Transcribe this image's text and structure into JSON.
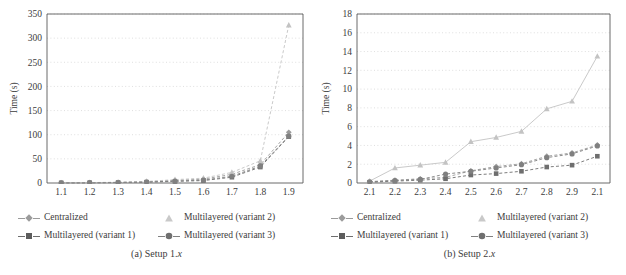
{
  "figure": {
    "panels": [
      {
        "id": "panel-a",
        "caption_prefix": "(a)",
        "caption_text": "Setup 1.",
        "caption_italic": "x",
        "ylabel": "Time (s)"
      },
      {
        "id": "panel-b",
        "caption_prefix": "(b)",
        "caption_text": "Setup 2.",
        "caption_italic": "x",
        "ylabel": "Time (s)"
      }
    ],
    "legend": {
      "entries": [
        {
          "label": "Centralized",
          "marker": "diamond-marker",
          "color": "#9b9b9b",
          "dash": "dashed"
        },
        {
          "label": "Multilayered (variant 2)",
          "marker": "triangle-marker",
          "color": "#c3c3c3",
          "dash": "solid"
        },
        {
          "label": "Multilayered (variant 1)",
          "marker": "square-marker",
          "color": "#6e6e6e",
          "dash": "dashed"
        },
        {
          "label": "Multilayered (variant 3)",
          "marker": "circle-marker",
          "color": "#808080",
          "dash": "dashed"
        }
      ]
    }
  },
  "chart_data": [
    {
      "type": "line",
      "title": "(a) Setup 1.x",
      "xlabel": "",
      "ylabel": "Time (s)",
      "categories": [
        "1.1",
        "1.2",
        "1.3",
        "1.4",
        "1.5",
        "1.6",
        "1.7",
        "1.8",
        "1.9"
      ],
      "xtick_labels": [
        "1.1",
        "1.2",
        "1.3",
        "1.4",
        "1.5",
        "1.6",
        "1.7",
        "1.8",
        "1.9"
      ],
      "ytick_labels": [
        "0",
        "50",
        "100",
        "150",
        "200",
        "250",
        "300",
        "350"
      ],
      "ylim": [
        0,
        350
      ],
      "ytick_step": 50,
      "grid": "horizontal-dotted",
      "legend_position": "below",
      "series": [
        {
          "name": "Centralized",
          "color": "#9b9b9b",
          "marker": "diamond",
          "dash": "dashed",
          "values": [
            0.4,
            0.7,
            1.2,
            2.6,
            5.5,
            8.0,
            18.0,
            38.0,
            105.0
          ]
        },
        {
          "name": "Multilayered (variant 1)",
          "color": "#6e6e6e",
          "marker": "square",
          "dash": "dashed",
          "values": [
            0.3,
            0.5,
            0.9,
            1.8,
            3.4,
            5.0,
            12.0,
            33.0,
            96.0
          ]
        },
        {
          "name": "Multilayered (variant 2)",
          "color": "#c3c3c3",
          "marker": "triangle",
          "dash": "dashed",
          "values": [
            0.5,
            0.9,
            1.6,
            3.2,
            7.0,
            10.0,
            22.0,
            46.0,
            327.0
          ]
        },
        {
          "name": "Multilayered (variant 3)",
          "color": "#808080",
          "marker": "circle",
          "dash": "dashed",
          "values": [
            0.3,
            0.6,
            1.0,
            2.0,
            4.0,
            6.0,
            14.0,
            35.0,
            97.0
          ]
        }
      ]
    },
    {
      "type": "line",
      "title": "(b) Setup 2.x",
      "xlabel": "",
      "ylabel": "Time (s)",
      "categories": [
        "2.1",
        "2.2",
        "2.3",
        "2.4",
        "2.5",
        "2.6",
        "2.7",
        "2.8",
        "2.9",
        "2.1"
      ],
      "xtick_labels": [
        "2.1",
        "2.2",
        "2.3",
        "2.4",
        "2.5",
        "2.6",
        "2.7",
        "2.8",
        "2.9",
        "2.1"
      ],
      "ytick_labels": [
        "0",
        "2",
        "4",
        "6",
        "8",
        "10",
        "12",
        "14",
        "16",
        "18"
      ],
      "ylim": [
        0,
        18
      ],
      "ytick_step": 2,
      "grid": "horizontal-dotted",
      "legend_position": "below",
      "series": [
        {
          "name": "Centralized",
          "color": "#9b9b9b",
          "marker": "diamond",
          "dash": "dashed",
          "values": [
            0.15,
            0.3,
            0.45,
            0.6,
            1.3,
            1.75,
            2.05,
            2.85,
            3.2,
            4.05
          ]
        },
        {
          "name": "Multilayered (variant 1)",
          "color": "#6e6e6e",
          "marker": "square",
          "dash": "dashed",
          "values": [
            0.08,
            0.2,
            0.3,
            0.45,
            0.85,
            1.0,
            1.25,
            1.7,
            1.9,
            2.85
          ]
        },
        {
          "name": "Multilayered (variant 2)",
          "color": "#c3c3c3",
          "marker": "triangle",
          "dash": "solid",
          "values": [
            0.2,
            1.6,
            1.9,
            2.2,
            4.4,
            4.85,
            5.5,
            7.9,
            8.7,
            13.5
          ]
        },
        {
          "name": "Multilayered (variant 3)",
          "color": "#808080",
          "marker": "circle",
          "dash": "dashed",
          "values": [
            0.12,
            0.25,
            0.38,
            0.95,
            1.25,
            1.6,
            1.95,
            2.7,
            3.1,
            3.95
          ]
        }
      ]
    }
  ]
}
